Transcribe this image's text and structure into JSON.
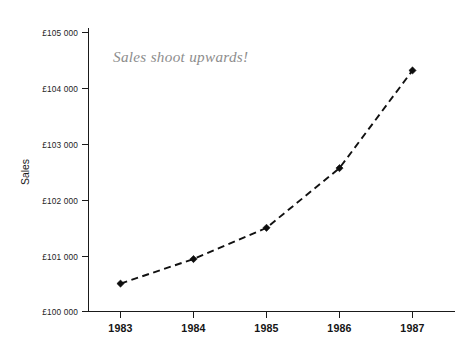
{
  "chart_data": {
    "type": "line",
    "title": "",
    "xlabel": "",
    "ylabel": "Sales",
    "categories": [
      "1983",
      "1984",
      "1985",
      "1986",
      "1987"
    ],
    "x": [
      1983,
      1984,
      1985,
      1986,
      1987
    ],
    "values": [
      100500,
      100940,
      101500,
      102570,
      104320
    ],
    "series": [
      {
        "name": "Sales",
        "values": [
          100500,
          100940,
          101500,
          102570,
          104320
        ]
      }
    ],
    "ylim": [
      100000,
      105000
    ],
    "ytick_values": [
      100000,
      101000,
      102000,
      103000,
      104000,
      105000
    ],
    "ytick_labels": [
      "£100 000",
      "£101 000",
      "£102 000",
      "£103 000",
      "£104 000",
      "£105 000"
    ],
    "xtick_labels": [
      "1983",
      "1984",
      "1985",
      "1986",
      "1987"
    ],
    "grid": false,
    "legend": false,
    "legend_position": "none",
    "line_style": "dashed",
    "marker_style": "filled-diamond",
    "annotations": [
      {
        "text": "Sales shoot upwards!",
        "style": "italic-serif-gray",
        "color": "#8d8d8d"
      }
    ],
    "colors": {
      "line": "#111111",
      "marker": "#0d0d0d",
      "axis": "#1a1a1a",
      "tick_text": "#1c1c1c",
      "annotation": "#8d8d8d",
      "background": "#ffffff"
    }
  },
  "axis": {
    "y_title": "Sales"
  },
  "ticks": {
    "y": [
      {
        "label": "£105 000",
        "value": 105000
      },
      {
        "label": "£104 000",
        "value": 104000
      },
      {
        "label": "£103 000",
        "value": 103000
      },
      {
        "label": "£102 000",
        "value": 102000
      },
      {
        "label": "£101 000",
        "value": 101000
      },
      {
        "label": "£100 000",
        "value": 100000
      }
    ],
    "x": [
      {
        "label": "1983"
      },
      {
        "label": "1984"
      },
      {
        "label": "1985"
      },
      {
        "label": "1986"
      },
      {
        "label": "1987"
      }
    ]
  },
  "annotation": {
    "text": "Sales shoot upwards!"
  }
}
